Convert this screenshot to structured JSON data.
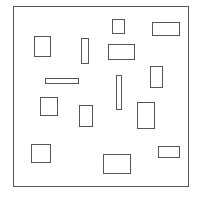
{
  "diagram": {
    "stroke_color": "#555555",
    "background": "#ffffff",
    "frame": {
      "x": 13,
      "y": 6,
      "w": 176,
      "h": 181
    },
    "rectangles": [
      {
        "id": "A",
        "x": 34,
        "y": 36,
        "w": 17,
        "h": 21
      },
      {
        "id": "B",
        "x": 81,
        "y": 38,
        "w": 8,
        "h": 26
      },
      {
        "id": "C",
        "x": 45,
        "y": 78,
        "w": 34,
        "h": 6
      },
      {
        "id": "D",
        "x": 112,
        "y": 19,
        "w": 13,
        "h": 15
      },
      {
        "id": "E",
        "x": 152,
        "y": 22,
        "w": 28,
        "h": 14
      },
      {
        "id": "F",
        "x": 108,
        "y": 44,
        "w": 27,
        "h": 16
      },
      {
        "id": "G",
        "x": 150,
        "y": 66,
        "w": 13,
        "h": 22
      },
      {
        "id": "H",
        "x": 116,
        "y": 75,
        "w": 6,
        "h": 35
      },
      {
        "id": "I",
        "x": 40,
        "y": 97,
        "w": 18,
        "h": 19
      },
      {
        "id": "J",
        "x": 79,
        "y": 105,
        "w": 14,
        "h": 22
      },
      {
        "id": "K",
        "x": 31,
        "y": 144,
        "w": 20,
        "h": 19
      },
      {
        "id": "L",
        "x": 137,
        "y": 102,
        "w": 18,
        "h": 27
      },
      {
        "id": "M",
        "x": 103,
        "y": 154,
        "w": 28,
        "h": 20
      },
      {
        "id": "N",
        "x": 158,
        "y": 146,
        "w": 22,
        "h": 12
      }
    ]
  }
}
